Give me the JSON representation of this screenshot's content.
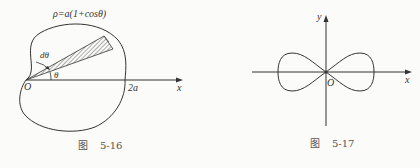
{
  "figures": [
    {
      "id": "fig-5-16",
      "caption_prefix": "图",
      "caption_number": "5-16",
      "curve_label": "ρ=a(1+cosθ)",
      "labels": {
        "origin": "O",
        "x_axis": "x",
        "intercept": "2a",
        "dtheta": "dθ",
        "theta": "θ"
      },
      "description": "Cardioid with shaded sector of angle dθ at angle θ"
    },
    {
      "id": "fig-5-17",
      "caption_prefix": "图",
      "caption_number": "5-17",
      "labels": {
        "origin": "O",
        "x_axis": "x",
        "y_axis": "y"
      },
      "description": "Lemniscate centered at origin"
    }
  ],
  "colors": {
    "stroke": "#333333",
    "background": "#fbfbf9"
  }
}
